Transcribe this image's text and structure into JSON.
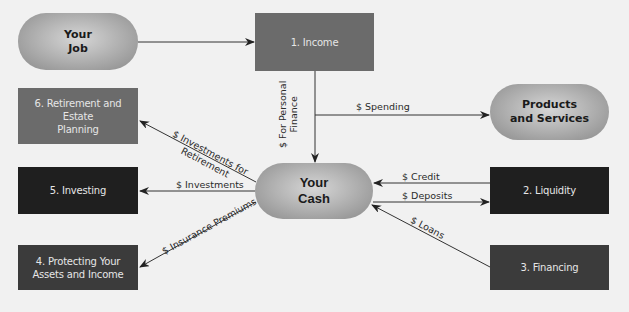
{
  "diagram": {
    "nodes": {
      "your_job": "Your\nJob",
      "income": "1. Income",
      "retirement": "6. Retirement and Estate\nPlanning",
      "products": "Products\nand Services",
      "investing": "5. Investing",
      "your_cash": "Your\nCash",
      "liquidity": "2. Liquidity",
      "protecting": "4. Protecting Your\nAssets and Income",
      "financing": "3. Financing"
    },
    "edges": {
      "for_personal_finance": "$ For Personal\nFinance",
      "spending": "$ Spending",
      "investments_for_retirement": "$ Investments for\nRetirement",
      "investments": "$ Investments",
      "insurance_premiums": "$ Insurance Premiums",
      "credit": "$ Credit",
      "deposits": "$ Deposits",
      "loans": "$ Loans"
    },
    "colors": {
      "background": "#f1f1f1",
      "box_mid": "#6b6b6b",
      "box_dark": "#1f1f1f",
      "box_darkgray": "#3b3b3b",
      "pill": "#b4b4b4"
    }
  }
}
